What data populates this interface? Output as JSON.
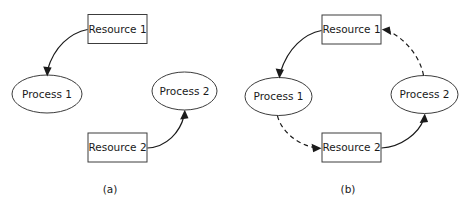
{
  "figure": {
    "background_color": "#ffffff",
    "stroke_color": "#1a1a1a",
    "node_stroke_color": "#3c3c3c",
    "node_fill_color": "#ffffff"
  },
  "panels": [
    {
      "id": "panel-a",
      "caption": "(a)",
      "nodes": [
        {
          "id": "a-resource-1",
          "label": "Resource 1",
          "shape": "rectangle",
          "cx": 117.5,
          "cy": 29
        },
        {
          "id": "a-process-1",
          "label": "Process 1",
          "shape": "ellipse",
          "cx": 47,
          "cy": 94
        },
        {
          "id": "a-process-2",
          "label": "Process 2",
          "shape": "ellipse",
          "cx": 184.5,
          "cy": 91
        },
        {
          "id": "a-resource-2",
          "label": "Resource 2",
          "shape": "rectangle",
          "cx": 117.5,
          "cy": 147.5
        }
      ],
      "edges": [
        {
          "id": "a-edge-r1-p1",
          "from": "a-resource-1",
          "to": "a-process-1",
          "style": "solid"
        },
        {
          "id": "a-edge-r2-p2",
          "from": "a-resource-2",
          "to": "a-process-2",
          "style": "solid"
        }
      ]
    },
    {
      "id": "panel-b",
      "caption": "(b)",
      "nodes": [
        {
          "id": "b-resource-1",
          "label": "Resource 1",
          "shape": "rectangle",
          "cx": 351.5,
          "cy": 29.5
        },
        {
          "id": "b-process-1",
          "label": "Process 1",
          "shape": "ellipse",
          "cx": 278.5,
          "cy": 96.5
        },
        {
          "id": "b-process-2",
          "label": "Process 2",
          "shape": "ellipse",
          "cx": 424.5,
          "cy": 94.5
        },
        {
          "id": "b-resource-2",
          "label": "Resource 2",
          "shape": "rectangle",
          "cx": 351.5,
          "cy": 147.5
        }
      ],
      "edges": [
        {
          "id": "b-edge-r1-p1",
          "from": "b-resource-1",
          "to": "b-process-1",
          "style": "solid"
        },
        {
          "id": "b-edge-p1-r2",
          "from": "b-process-1",
          "to": "b-resource-2",
          "style": "dashed"
        },
        {
          "id": "b-edge-r2-p2",
          "from": "b-resource-2",
          "to": "b-process-2",
          "style": "solid"
        },
        {
          "id": "b-edge-p2-r1",
          "from": "b-process-2",
          "to": "b-resource-1",
          "style": "dashed"
        }
      ]
    }
  ]
}
